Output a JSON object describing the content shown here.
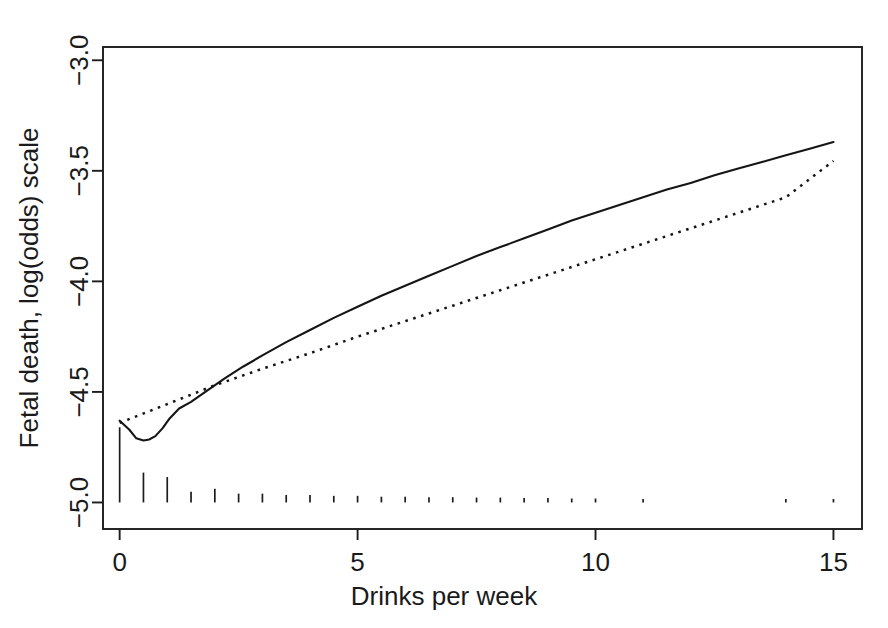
{
  "chart_data": {
    "type": "line",
    "title": "",
    "subtitle": "",
    "xlabel": "Drinks per week",
    "ylabel": "Fetal death, log(odds) scale",
    "xlim": [
      -0.35,
      15.6
    ],
    "ylim": [
      -5.12,
      -2.94
    ],
    "xticks": [
      0,
      5,
      10,
      15
    ],
    "xticklabels": [
      "0",
      "5",
      "10",
      "15"
    ],
    "yticks": [
      -3.0,
      -3.5,
      -4.0,
      -4.5,
      -5.0
    ],
    "yticklabels": [
      "-3.0",
      "-3.5",
      "-4.0",
      "-4.5",
      "-5.0"
    ],
    "grid": false,
    "legend": "none",
    "box": true,
    "series": [
      {
        "name": "Spline fit (solid)",
        "style": "solid",
        "x": [
          0.0,
          0.2,
          0.35,
          0.5,
          0.62,
          0.75,
          0.9,
          1.05,
          1.25,
          1.5,
          1.8,
          2.2,
          2.6,
          3.0,
          3.5,
          4.0,
          4.5,
          5.0,
          5.5,
          6.0,
          6.5,
          7.0,
          7.5,
          8.0,
          8.5,
          9.0,
          9.5,
          10.0,
          10.5,
          11.0,
          11.5,
          12.0,
          12.5,
          13.0,
          13.5,
          14.0,
          14.5,
          15.0
        ],
        "y": [
          -4.63,
          -4.67,
          -4.71,
          -4.72,
          -4.715,
          -4.7,
          -4.665,
          -4.62,
          -4.575,
          -4.545,
          -4.5,
          -4.44,
          -4.385,
          -4.335,
          -4.275,
          -4.22,
          -4.165,
          -4.115,
          -4.065,
          -4.02,
          -3.975,
          -3.93,
          -3.885,
          -3.845,
          -3.805,
          -3.765,
          -3.725,
          -3.69,
          -3.655,
          -3.62,
          -3.585,
          -3.555,
          -3.52,
          -3.49,
          -3.46,
          -3.43,
          -3.4,
          -3.37
        ]
      },
      {
        "name": "Linear fit (dotted)",
        "style": "dotted",
        "x": [
          0.0,
          1.0,
          2.0,
          3.0,
          4.0,
          5.0,
          6.0,
          7.0,
          8.0,
          9.0,
          10.0,
          11.0,
          12.0,
          13.0,
          14.0,
          15.0
        ],
        "y": [
          -4.64,
          -4.555,
          -4.47,
          -4.395,
          -4.325,
          -4.25,
          -4.18,
          -4.11,
          -4.04,
          -3.97,
          -3.9,
          -3.83,
          -3.76,
          -3.69,
          -3.62,
          -3.455
        ]
      }
    ],
    "rug": {
      "name": "data-density rug",
      "description": "vertical tick marks along the bottom, height proportional to observation count",
      "baseline": -5.0,
      "marks": [
        {
          "x": 0.0,
          "height": 0.34
        },
        {
          "x": 0.5,
          "height": 0.135
        },
        {
          "x": 1.0,
          "height": 0.115
        },
        {
          "x": 1.5,
          "height": 0.048
        },
        {
          "x": 2.0,
          "height": 0.062
        },
        {
          "x": 2.5,
          "height": 0.04
        },
        {
          "x": 3.0,
          "height": 0.04
        },
        {
          "x": 3.5,
          "height": 0.034
        },
        {
          "x": 4.0,
          "height": 0.034
        },
        {
          "x": 4.5,
          "height": 0.03
        },
        {
          "x": 5.0,
          "height": 0.03
        },
        {
          "x": 5.5,
          "height": 0.026
        },
        {
          "x": 6.0,
          "height": 0.026
        },
        {
          "x": 6.5,
          "height": 0.024
        },
        {
          "x": 7.0,
          "height": 0.024
        },
        {
          "x": 7.5,
          "height": 0.022
        },
        {
          "x": 8.0,
          "height": 0.022
        },
        {
          "x": 8.5,
          "height": 0.02
        },
        {
          "x": 9.0,
          "height": 0.02
        },
        {
          "x": 9.5,
          "height": 0.018
        },
        {
          "x": 10.0,
          "height": 0.018
        },
        {
          "x": 11.0,
          "height": 0.016
        },
        {
          "x": 14.0,
          "height": 0.016
        },
        {
          "x": 15.0,
          "height": 0.016
        }
      ]
    }
  },
  "colors": {
    "background": "#ffffff",
    "foreground": "#1a1a1a",
    "curve": "#151515"
  }
}
